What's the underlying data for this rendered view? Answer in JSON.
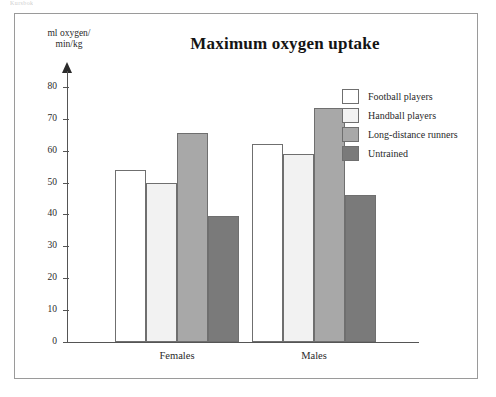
{
  "top_caption": "Kursbok",
  "figure": {
    "title": "Maximum oxygen uptake",
    "y_axis_title_line1": "ml oxygen/",
    "y_axis_title_line2": "min/kg"
  },
  "legend": {
    "items": [
      {
        "label": "Football players",
        "color": "#ffffff"
      },
      {
        "label": "Handball players",
        "color": "#f2f2f2"
      },
      {
        "label": "Long-distance runners",
        "color": "#a8a8a8"
      },
      {
        "label": "Untrained",
        "color": "#7a7a7a"
      }
    ]
  },
  "axis": {
    "y_ticks": [
      "80",
      "70",
      "60",
      "50",
      "40",
      "30",
      "20",
      "10",
      "0"
    ],
    "x_categories": [
      "Females",
      "Males"
    ]
  },
  "chart_data": {
    "type": "bar",
    "title": "Maximum oxygen uptake",
    "xlabel": "",
    "ylabel": "ml oxygen/min/kg",
    "ylim": [
      0,
      85
    ],
    "ytick_step": 10,
    "grid": false,
    "legend_position": "top-right",
    "categories": [
      "Females",
      "Males"
    ],
    "series": [
      {
        "name": "Football players",
        "color": "#ffffff",
        "values": [
          54,
          62
        ]
      },
      {
        "name": "Handball players",
        "color": "#f2f2f2",
        "values": [
          50,
          59
        ]
      },
      {
        "name": "Long-distance runners",
        "color": "#a8a8a8",
        "values": [
          65.5,
          73.5
        ]
      },
      {
        "name": "Untrained",
        "color": "#7a7a7a",
        "values": [
          39.5,
          46
        ]
      }
    ]
  }
}
